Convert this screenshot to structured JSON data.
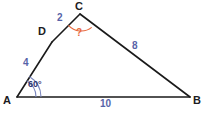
{
  "figure": {
    "type": "geometry-diagram",
    "shape": "triangle",
    "background_color": "#ffffff",
    "stroke_color": "#1a1a1a",
    "side_label_color": "#5763a8",
    "vertex_label_color": "#1c1c22",
    "angle_label_color": "#2c3470",
    "unknown_color": "#e8683c",
    "angle_arc_color": "#7a86bd"
  },
  "vertices": [
    {
      "name": "A",
      "label": "A",
      "x": 17,
      "y": 97,
      "label_x": 3,
      "label_y": 95
    },
    {
      "name": "B",
      "label": "B",
      "x": 190,
      "y": 97,
      "label_x": 193,
      "label_y": 95
    },
    {
      "name": "C",
      "label": "C",
      "x": 80,
      "y": 14,
      "label_x": 75,
      "label_y": 1
    },
    {
      "name": "D",
      "label": "D",
      "x": 52,
      "y": 42,
      "label_x": 38,
      "label_y": 26
    }
  ],
  "segments": [
    {
      "name": "AD",
      "from": "A",
      "to": "D",
      "length_label": "4",
      "label_x": 23,
      "label_y": 58
    },
    {
      "name": "DC",
      "from": "D",
      "to": "C",
      "length_label": "2",
      "label_x": 57,
      "label_y": 13
    },
    {
      "name": "CB",
      "from": "C",
      "to": "B",
      "length_label": "8",
      "label_x": 132,
      "label_y": 41
    },
    {
      "name": "AB",
      "from": "A",
      "to": "B",
      "length_label": "10",
      "label_x": 100,
      "label_y": 99
    }
  ],
  "angles": [
    {
      "name": "angle-A",
      "vertex": "A",
      "label": "60°",
      "label_x": 28,
      "label_y": 80,
      "arc_style": "double",
      "known": true
    },
    {
      "name": "angle-C",
      "vertex": "C",
      "label": "?",
      "label_x": 76,
      "label_y": 28,
      "arc_style": "single",
      "known": false
    }
  ]
}
